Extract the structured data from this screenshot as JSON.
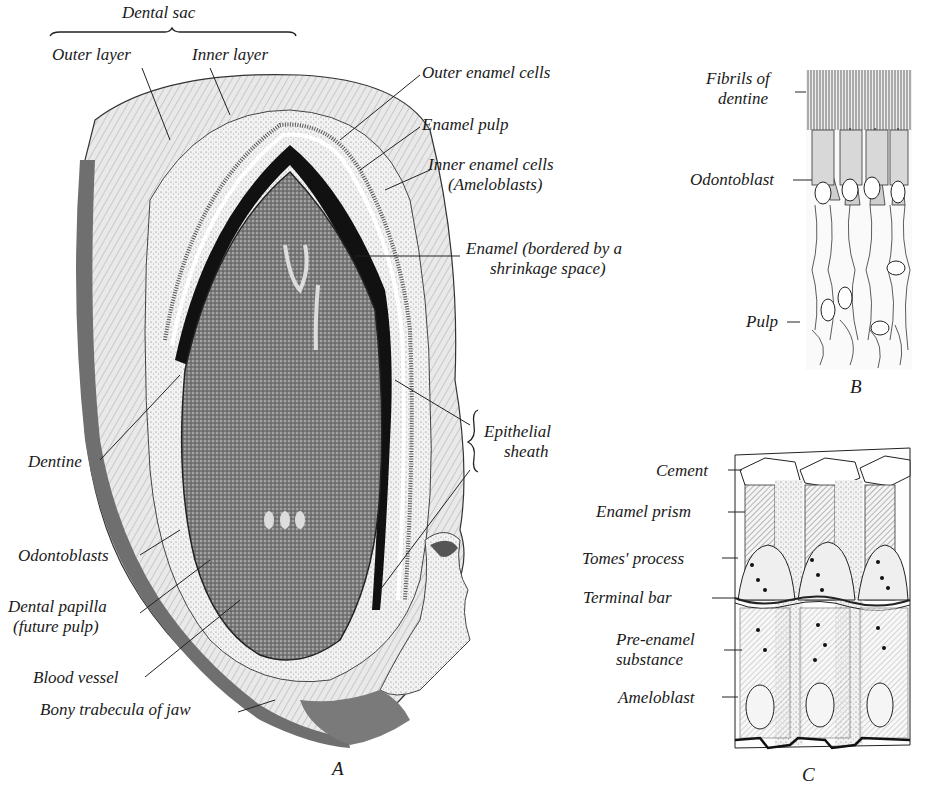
{
  "figure": {
    "panels": [
      {
        "id": "A",
        "letter": "A"
      },
      {
        "id": "B",
        "letter": "B"
      },
      {
        "id": "C",
        "letter": "C"
      }
    ]
  },
  "panel_a": {
    "group_label": "Dental sac",
    "labels": {
      "outer_layer": "Outer layer",
      "inner_layer": "Inner layer",
      "outer_enamel_cells": "Outer enamel cells",
      "enamel_pulp": "Enamel pulp",
      "inner_enamel_cells_1": "Inner enamel cells",
      "inner_enamel_cells_2": "(Ameloblasts)",
      "enamel_1": "Enamel (bordered by a",
      "enamel_2": "shrinkage space)",
      "epithelial_sheath_1": "Epithelial",
      "epithelial_sheath_2": "sheath",
      "dentine": "Dentine",
      "odontoblasts": "Odontoblasts",
      "dental_papilla_1": "Dental papilla",
      "dental_papilla_2": "(future pulp)",
      "blood_vessel": "Blood vessel",
      "bony_trabecula": "Bony trabecula of jaw"
    },
    "letter": "A"
  },
  "panel_b": {
    "labels": {
      "fibrils_1": "Fibrils of",
      "fibrils_2": "dentine",
      "odontoblast": "Odontoblast",
      "pulp": "Pulp"
    },
    "letter": "B"
  },
  "panel_c": {
    "labels": {
      "cement": "Cement",
      "enamel_prism": "Enamel prism",
      "tomes_process": "Tomes' process",
      "terminal_bar": "Terminal bar",
      "pre_enamel_1": "Pre-enamel",
      "pre_enamel_2": "substance",
      "ameloblast": "Ameloblast"
    },
    "letter": "C"
  }
}
